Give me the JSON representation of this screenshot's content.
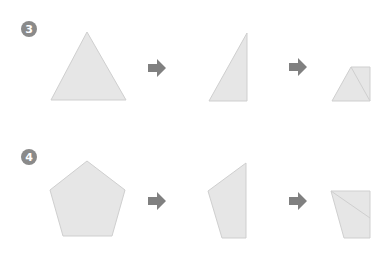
{
  "colors": {
    "shape_fill": "#e6e6e6",
    "shape_stroke": "#cfcfcf",
    "arrow": "#808080",
    "badge": "#8a8a8a",
    "badge_text": "#ffffff"
  },
  "rows": [
    {
      "step_number": "3",
      "steps": [
        {
          "shape": "equilateral-triangle"
        },
        {
          "shape": "right-triangle-half"
        },
        {
          "shape": "folded-trapezoid"
        }
      ]
    },
    {
      "step_number": "4",
      "steps": [
        {
          "shape": "regular-pentagon"
        },
        {
          "shape": "half-pentagon"
        },
        {
          "shape": "folded-quadrilateral"
        }
      ]
    }
  ],
  "arrow_icon": "right-arrow-icon"
}
